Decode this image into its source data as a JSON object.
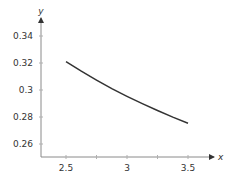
{
  "chart_data": {
    "type": "line",
    "title": "",
    "xlabel": "x",
    "ylabel": "y",
    "xlim": [
      2.3,
      3.75
    ],
    "ylim": [
      0.25,
      0.35
    ],
    "x_ticks": [
      2.5,
      3,
      3.5
    ],
    "x_tick_labels": [
      "2.5",
      "3",
      "3.5"
    ],
    "x_minor_ticks": [
      2.75,
      3.25
    ],
    "y_ticks": [
      0.26,
      0.28,
      0.3,
      0.32,
      0.34
    ],
    "y_tick_labels": [
      "0.26",
      "0.28",
      "0.3",
      "0.32",
      "0.34"
    ],
    "grid": false,
    "series": [
      {
        "name": "curve",
        "color": "#333333",
        "x": [
          2.5,
          2.625,
          2.75,
          2.875,
          3.0,
          3.125,
          3.25,
          3.375,
          3.5
        ],
        "y": [
          0.321,
          0.3139,
          0.3073,
          0.301,
          0.2953,
          0.2899,
          0.2848,
          0.2799,
          0.2754
        ]
      }
    ]
  }
}
